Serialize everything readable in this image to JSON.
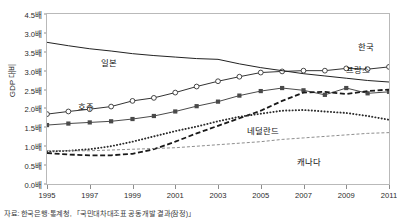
{
  "chart_data": {
    "type": "line",
    "title": "",
    "xlabel": "",
    "ylabel": "GDP 대비",
    "xlim": [
      1995,
      2011
    ],
    "ylim": [
      0.0,
      4.5
    ],
    "grid": false,
    "legend_position": "inline-annotations",
    "x": [
      1995,
      1996,
      1997,
      1998,
      1999,
      2000,
      2001,
      2002,
      2003,
      2004,
      2005,
      2006,
      2007,
      2008,
      2009,
      2010,
      2011
    ],
    "ytick_labels": [
      "4.5배",
      "3.0배",
      "3.5배",
      "3.0배",
      "2.5배",
      "2.0배",
      "1.5배",
      "1.0배",
      "0.5배",
      "0.0배"
    ],
    "ytick_values": [
      4.5,
      4.0,
      3.5,
      3.0,
      2.5,
      2.0,
      1.5,
      1.0,
      0.5,
      0.0
    ],
    "xtick_labels": [
      "1995",
      "1997",
      "1999",
      "2001",
      "2003",
      "2005",
      "2007",
      "2009",
      "2011"
    ],
    "xtick_values": [
      1995,
      1997,
      1999,
      2001,
      2003,
      2005,
      2007,
      2009,
      2011
    ],
    "series": [
      {
        "name": "한국",
        "label": "한국",
        "marker": "open-circle",
        "line_style": "solid",
        "color": "#333333",
        "values": [
          1.85,
          1.92,
          1.98,
          2.05,
          2.2,
          2.28,
          2.42,
          2.58,
          2.72,
          2.84,
          2.95,
          2.98,
          3.0,
          3.0,
          3.06,
          3.04,
          3.1
        ]
      },
      {
        "name": "일본",
        "label": "일본",
        "marker": "none",
        "line_style": "solid",
        "color": "#222222",
        "values": [
          3.75,
          3.66,
          3.58,
          3.52,
          3.45,
          3.4,
          3.36,
          3.32,
          3.3,
          3.18,
          3.08,
          3.0,
          2.92,
          2.86,
          2.8,
          2.74,
          2.7
        ]
      },
      {
        "name": "호주",
        "label": "호주",
        "marker": "filled-square",
        "line_style": "solid",
        "color": "#4a4a4a",
        "values": [
          1.56,
          1.6,
          1.63,
          1.66,
          1.72,
          1.8,
          1.92,
          2.06,
          2.18,
          2.34,
          2.46,
          2.54,
          2.48,
          2.36,
          2.54,
          2.4,
          2.44
        ]
      },
      {
        "name": "프랑스",
        "label": "프랑스",
        "marker": "none",
        "line_style": "heavy-dashed",
        "color": "#1a1a1a",
        "values": [
          0.82,
          0.78,
          0.76,
          0.76,
          0.8,
          0.92,
          1.12,
          1.34,
          1.54,
          1.74,
          1.94,
          2.2,
          2.42,
          2.44,
          2.38,
          2.46,
          2.5
        ]
      },
      {
        "name": "네덜란드",
        "label": "네덜란드",
        "marker": "none",
        "line_style": "dotted",
        "color": "#2b2b2b",
        "values": [
          0.86,
          0.88,
          0.92,
          1.0,
          1.12,
          1.26,
          1.4,
          1.52,
          1.66,
          1.78,
          1.86,
          1.94,
          1.96,
          1.92,
          1.88,
          1.8,
          1.7
        ]
      },
      {
        "name": "캐나다",
        "label": "캐나다",
        "marker": "none",
        "line_style": "thin-dashed",
        "color": "#808080",
        "values": [
          0.88,
          0.88,
          0.88,
          0.9,
          0.92,
          0.94,
          0.96,
          1.0,
          1.04,
          1.08,
          1.12,
          1.18,
          1.22,
          1.26,
          1.3,
          1.34,
          1.36
        ]
      }
    ],
    "annotations": [
      {
        "text": "한국",
        "x": 366,
        "y": 40
      },
      {
        "text": "일본",
        "x": 109,
        "y": 56
      },
      {
        "text": "호주",
        "x": 86,
        "y": 100
      },
      {
        "text": "프랑스",
        "x": 358,
        "y": 63
      },
      {
        "text": "네덜란드",
        "x": 263,
        "y": 124
      },
      {
        "text": "캐나다",
        "x": 309,
        "y": 155
      }
    ]
  },
  "footnote": {
    "text": "자료: 한국은행·통계청, 「국민대차대조표 공동개발 결과(잠정)」"
  }
}
